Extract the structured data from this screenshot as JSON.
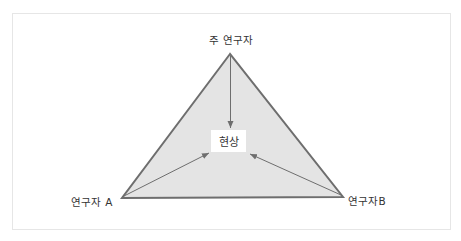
{
  "diagram": {
    "type": "triangle-relationship",
    "nodes": {
      "top": {
        "label": "주 연구자"
      },
      "bottom_left": {
        "label": "연구자 A"
      },
      "bottom_right": {
        "label": "연구자B"
      },
      "center": {
        "label": "현상"
      }
    },
    "edges": [
      {
        "from": "top",
        "to": "center",
        "style": "arrow"
      },
      {
        "from": "bottom_left",
        "to": "center",
        "style": "arrow"
      },
      {
        "from": "bottom_right",
        "to": "center",
        "style": "arrow"
      }
    ],
    "colors": {
      "triangle_fill": "#e4e4e4",
      "triangle_stroke": "#6e6e6e",
      "arrow": "#6e6e6e",
      "frame_border": "#e6e6e6",
      "center_box": "#ffffff",
      "text": "#333333"
    }
  }
}
